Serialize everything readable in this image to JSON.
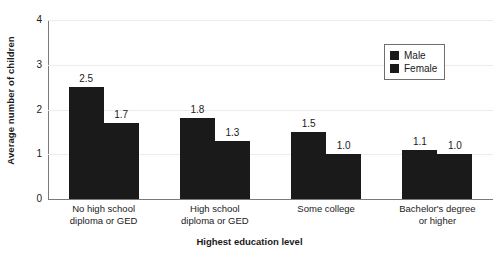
{
  "chart_data": {
    "type": "bar",
    "title": "",
    "xlabel": "Highest education level",
    "ylabel": "Average number of children",
    "categories": [
      "No high school\ndiploma or GED",
      "High school\ndiploma or GED",
      "Some college",
      "Bachelor's degree\nor higher"
    ],
    "category_lines": [
      [
        "No high school",
        "diploma or GED"
      ],
      [
        "High school",
        "diploma or GED"
      ],
      [
        "Some college",
        ""
      ],
      [
        "Bachelor's degree",
        "or higher"
      ]
    ],
    "series": [
      {
        "name": "Male",
        "values": [
          2.5,
          1.8,
          1.5,
          1.1
        ],
        "labels": [
          "2.5",
          "1.8",
          "1.5",
          "1.1"
        ],
        "color": "#1a1a1a"
      },
      {
        "name": "Female",
        "values": [
          1.7,
          1.3,
          1.0,
          1.0
        ],
        "labels": [
          "1.7",
          "1.3",
          "1.0",
          "1.0"
        ],
        "color": "#1a1a1a"
      }
    ],
    "ylim": [
      0,
      4
    ],
    "yticks": [
      0,
      1,
      2,
      3,
      4
    ],
    "ytick_labels": [
      "0",
      "1",
      "2",
      "3",
      "4"
    ],
    "grid": true,
    "grid_color": "#ececec",
    "axis_color": "#7a7a7a",
    "legend_position": "top-right",
    "legend_entries": [
      "Male",
      "Female"
    ]
  }
}
